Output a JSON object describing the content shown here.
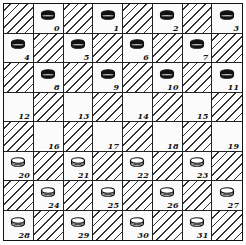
{
  "board": {
    "rows": 8,
    "cols": 8,
    "top_left_square": "hatched",
    "squares": [
      {
        "number": "0",
        "piece": "black"
      },
      {
        "number": "1",
        "piece": "black"
      },
      {
        "number": "2",
        "piece": "black"
      },
      {
        "number": "3",
        "piece": "black"
      },
      {
        "number": "4",
        "piece": "black"
      },
      {
        "number": "5",
        "piece": "black"
      },
      {
        "number": "6",
        "piece": "black"
      },
      {
        "number": "7",
        "piece": "black"
      },
      {
        "number": "8",
        "piece": "black"
      },
      {
        "number": "9",
        "piece": "black"
      },
      {
        "number": "10",
        "piece": "black"
      },
      {
        "number": "11",
        "piece": "black"
      },
      {
        "number": "12",
        "piece": null
      },
      {
        "number": "13",
        "piece": null
      },
      {
        "number": "14",
        "piece": null
      },
      {
        "number": "15",
        "piece": null
      },
      {
        "number": "16",
        "piece": null
      },
      {
        "number": "17",
        "piece": null
      },
      {
        "number": "18",
        "piece": null
      },
      {
        "number": "19",
        "piece": null
      },
      {
        "number": "20",
        "piece": "white"
      },
      {
        "number": "21",
        "piece": "white"
      },
      {
        "number": "22",
        "piece": "white"
      },
      {
        "number": "23",
        "piece": "white"
      },
      {
        "number": "24",
        "piece": "white"
      },
      {
        "number": "25",
        "piece": "white"
      },
      {
        "number": "26",
        "piece": "white"
      },
      {
        "number": "27",
        "piece": "white"
      },
      {
        "number": "28",
        "piece": "white"
      },
      {
        "number": "29",
        "piece": "white"
      },
      {
        "number": "30",
        "piece": "white"
      },
      {
        "number": "31",
        "piece": "white"
      }
    ]
  },
  "colors": {
    "black_piece": "#111111",
    "white_piece": "#ffffff",
    "outline": "#111111"
  }
}
